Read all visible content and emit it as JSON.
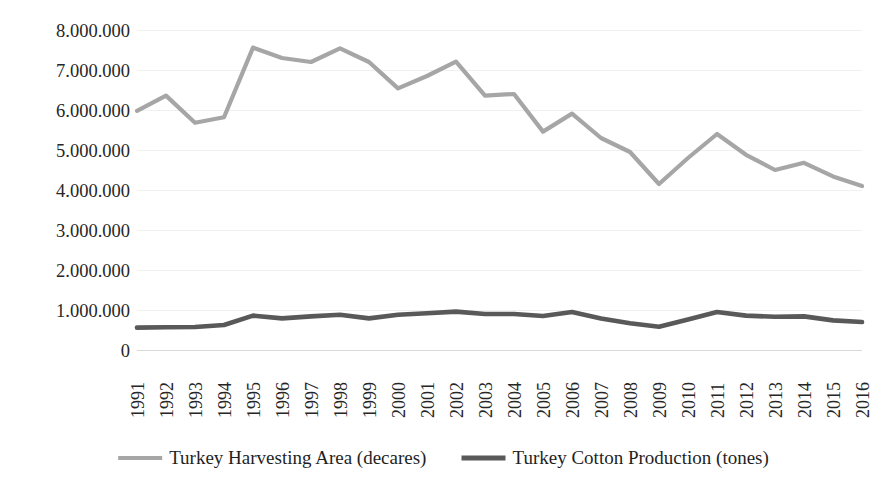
{
  "chart_data": {
    "type": "line",
    "title": "",
    "subtitle": "",
    "xlabel": "",
    "ylabel": "",
    "grid": true,
    "legend_position": "bottom",
    "x": [
      1991,
      1992,
      1993,
      1994,
      1995,
      1996,
      1997,
      1998,
      1999,
      2000,
      2001,
      2002,
      2003,
      2004,
      2005,
      2006,
      2007,
      2008,
      2009,
      2010,
      2011,
      2012,
      2013,
      2014,
      2015,
      2016
    ],
    "categories": [
      "1991",
      "1992",
      "1993",
      "1994",
      "1995",
      "1996",
      "1997",
      "1998",
      "1999",
      "2000",
      "2001",
      "2002",
      "2003",
      "2004",
      "2005",
      "2006",
      "2007",
      "2008",
      "2009",
      "2010",
      "2011",
      "2012",
      "2013",
      "2014",
      "2015",
      "2016"
    ],
    "ylim": [
      0,
      8000000
    ],
    "yticks": [
      0,
      1000000,
      2000000,
      3000000,
      4000000,
      5000000,
      6000000,
      7000000,
      8000000
    ],
    "ytick_labels": [
      "0",
      "1.000.000",
      "2.000.000",
      "3.000.000",
      "4.000.000",
      "5.000.000",
      "6.000.000",
      "7.000.000",
      "8.000.000"
    ],
    "series": [
      {
        "name": "Turkey Harvesting Area (decares)",
        "color": "#a6a6a6",
        "values": [
          5980000,
          6360000,
          5680000,
          5820000,
          7560000,
          7300000,
          7200000,
          7540000,
          7200000,
          6540000,
          6850000,
          7210000,
          6360000,
          6400000,
          5460000,
          5910000,
          5300000,
          4950000,
          4150000,
          4800000,
          5400000,
          4880000,
          4500000,
          4680000,
          4340000,
          4100000
        ]
      },
      {
        "name": "Turkey Cotton Production (tones)",
        "color": "#595959",
        "values": [
          560000,
          570000,
          575000,
          625000,
          860000,
          790000,
          840000,
          880000,
          790000,
          880000,
          920000,
          960000,
          900000,
          900000,
          850000,
          950000,
          790000,
          670000,
          580000,
          760000,
          950000,
          860000,
          830000,
          840000,
          740000,
          700000
        ]
      }
    ]
  },
  "legend": {
    "items": [
      {
        "label": "Turkey Harvesting Area (decares)",
        "color": "#a6a6a6"
      },
      {
        "label": "Turkey Cotton Production (tones)",
        "color": "#595959"
      }
    ]
  }
}
